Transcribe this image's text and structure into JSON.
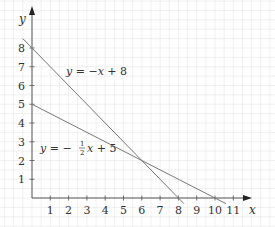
{
  "chart_data": {
    "type": "line",
    "title": "",
    "xlabel": "x",
    "ylabel": "y",
    "xlim": [
      0,
      12
    ],
    "ylim": [
      0,
      9
    ],
    "grid": true,
    "x_ticks": [
      "1",
      "2",
      "3",
      "4",
      "5",
      "6",
      "7",
      "8",
      "9",
      "10",
      "11"
    ],
    "y_ticks": [
      "1",
      "2",
      "3",
      "4",
      "5",
      "6",
      "7",
      "8"
    ],
    "series": [
      {
        "name": "y = -x + 8",
        "x": [
          -0.5,
          8.3
        ],
        "y": [
          8.5,
          -0.3
        ],
        "slope": -1,
        "intercept": 8
      },
      {
        "name": "y = -1/2 x + 5",
        "x": [
          0,
          10.6
        ],
        "y": [
          5,
          -0.3
        ],
        "slope": -0.5,
        "intercept": 5
      }
    ],
    "annotations": [
      {
        "text": "y = -x + 8",
        "x": 2.3,
        "y": 6.6
      },
      {
        "text": "y = -½x + 5",
        "x": 0.3,
        "y": 2.9
      }
    ],
    "intersection": {
      "x": 6,
      "y": 2
    }
  },
  "labels": {
    "x_axis": "x",
    "y_axis": "y",
    "eq1": {
      "y": "y",
      "eq": " = −",
      "x": "x",
      "rest": " + 8"
    },
    "eq2": {
      "y": "y",
      "eq": " = −",
      "frac_num": "1",
      "frac_den": "2",
      "x": "x",
      "rest": " + 5"
    }
  },
  "colors": {
    "grid": "#e6e6e6",
    "axis": "#555555",
    "line": "#777777",
    "text": "#333333"
  }
}
